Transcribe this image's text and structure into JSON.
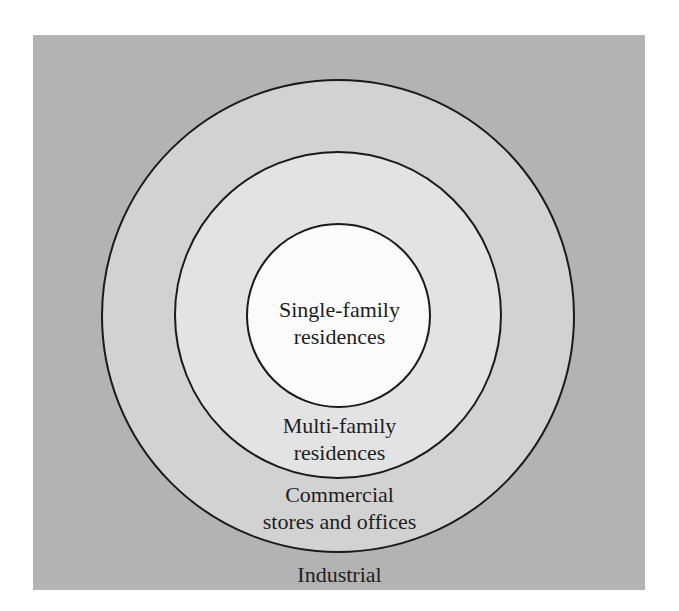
{
  "diagram": {
    "type": "concentric-zone-model",
    "colors": {
      "background": "#b3b3b3",
      "outer_ring": "#d2d2d2",
      "middle_ring": "#e3e3e3",
      "inner_ring": "#fbfbfb",
      "stroke": "#1a1a1a",
      "text": "#1e1e1e"
    },
    "zones": [
      {
        "id": "inner",
        "line1": "Single-family",
        "line2": "residences"
      },
      {
        "id": "middle",
        "line1": "Multi-family",
        "line2": "residences"
      },
      {
        "id": "outer",
        "line1": "Commercial",
        "line2": "stores and offices"
      },
      {
        "id": "background",
        "line1": "Industrial"
      }
    ]
  }
}
